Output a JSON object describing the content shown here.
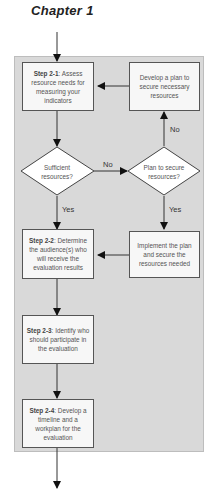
{
  "header": {
    "title": "Chapter 1"
  },
  "flowchart": {
    "panel_color": "#d9d9d9",
    "box_color": "#f7f7f7",
    "step_2_1": {
      "label": "Step 2-1",
      "text": ": Assess resource needs for measuring your indicators"
    },
    "develop_plan": {
      "text": "Develop a plan to secure necessary resources"
    },
    "decision_sufficient": {
      "text": "Sufficient resources?"
    },
    "decision_plan": {
      "text": "Plan to secure resources?"
    },
    "step_2_2": {
      "label": "Step 2-2",
      "text": ": Determine the audience(s) who will receive the evaluation results"
    },
    "implement_plan": {
      "text": "Implement the plan and secure the resources needed"
    },
    "step_2_3": {
      "label": "Step 2-3",
      "text": ": Identify who should participate in the evaluation"
    },
    "step_2_4": {
      "label": "Step 2-4",
      "text": ": Develop a timeline and a workplan for the evaluation"
    },
    "edge_labels": {
      "no_horizontal": "No",
      "no_vertical": "No",
      "yes_left": "Yes",
      "yes_right": "Yes"
    }
  }
}
